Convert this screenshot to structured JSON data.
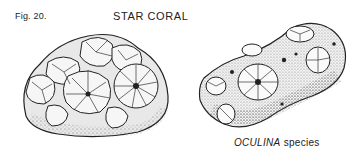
{
  "figure": {
    "label": "Fig. 20.",
    "title": "STAR CORAL"
  },
  "illustrations": [
    {
      "id": "star-coral",
      "name": "Star coral drawing"
    },
    {
      "id": "oculina",
      "name": "Oculina species drawing"
    }
  ],
  "caption": {
    "genus": "OCULINA",
    "rest": " species"
  },
  "colors": {
    "ink": "#222222",
    "paper": "#ffffff"
  }
}
